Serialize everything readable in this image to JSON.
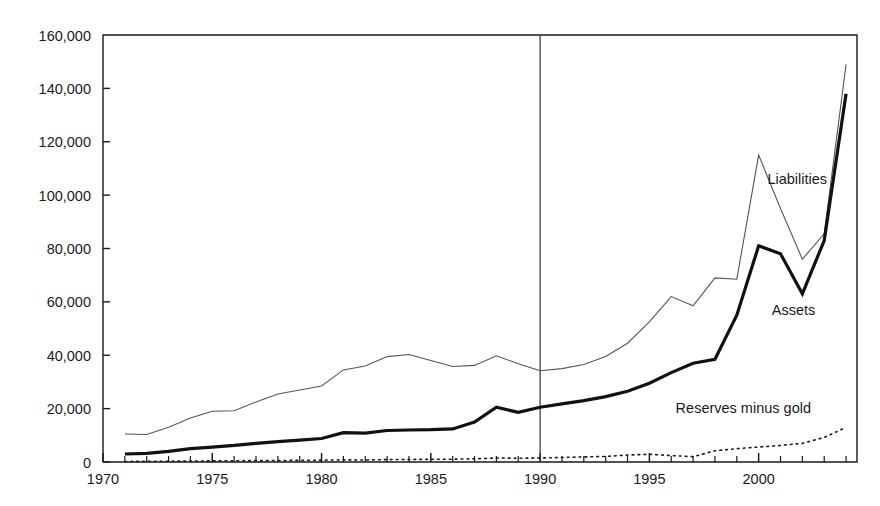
{
  "chart_data": {
    "type": "line",
    "title": "",
    "subtitle": "",
    "xlabel": "",
    "ylabel": "",
    "xlim": [
      1970,
      2004.5
    ],
    "ylim": [
      0,
      160000
    ],
    "grid": false,
    "legend_position": "inline-annotations",
    "y_ticks": [
      0,
      20000,
      40000,
      60000,
      80000,
      100000,
      120000,
      140000,
      160000
    ],
    "y_tick_labels": [
      "0",
      "20,000",
      "40,000",
      "60,000",
      "80,000",
      "100,000",
      "120,000",
      "140,000",
      "160,000"
    ],
    "x_ticks": [
      1970,
      1975,
      1980,
      1985,
      1990,
      1995,
      2000
    ],
    "x_tick_labels": [
      "1970",
      "1975",
      "1980",
      "1985",
      "1990",
      "1995",
      "2000"
    ],
    "x_minor_tick_interval": 1,
    "annotations": [
      {
        "text": "Liabilities",
        "x": 2000.4,
        "y": 104000
      },
      {
        "text": "Assets",
        "x": 2000.6,
        "y": 55000
      },
      {
        "text": "Reserves minus gold",
        "x": 1996.2,
        "y": 18500
      }
    ],
    "reference_lines": [
      {
        "orientation": "vertical",
        "x": 1990,
        "color": "#333333",
        "width": 1.2
      }
    ],
    "x": [
      1971,
      1972,
      1973,
      1974,
      1975,
      1976,
      1977,
      1978,
      1979,
      1980,
      1981,
      1982,
      1983,
      1984,
      1985,
      1986,
      1987,
      1988,
      1989,
      1990,
      1991,
      1992,
      1993,
      1994,
      1995,
      1996,
      1997,
      1998,
      1999,
      2000,
      2001,
      2002,
      2003,
      2004
    ],
    "series": [
      {
        "name": "Liabilities",
        "style": "thin-solid",
        "color": "#555555",
        "line_width": 1.1,
        "values": [
          10500,
          10300,
          13000,
          16500,
          19000,
          19200,
          22500,
          25500,
          27000,
          28500,
          34500,
          36000,
          39500,
          40300,
          38000,
          35800,
          36200,
          39800,
          36800,
          34200,
          35000,
          36500,
          39500,
          44500,
          52500,
          62000,
          58500,
          69000,
          68500,
          115000,
          95000,
          76000,
          85500,
          149000
        ]
      },
      {
        "name": "Assets",
        "style": "thick-solid",
        "color": "#111111",
        "line_width": 3.2,
        "values": [
          3000,
          3200,
          4000,
          5000,
          5600,
          6200,
          7000,
          7600,
          8200,
          8800,
          11000,
          10800,
          11800,
          12000,
          12100,
          12400,
          15000,
          20500,
          18600,
          20500,
          21800,
          23000,
          24500,
          26500,
          29500,
          33500,
          37000,
          38500,
          55000,
          81000,
          78000,
          63000,
          83000,
          138000
        ]
      },
      {
        "name": "Reserves minus gold",
        "style": "dotted",
        "color": "#1a1a1a",
        "line_width": 1.6,
        "values": [
          200,
          250,
          300,
          350,
          420,
          480,
          520,
          560,
          620,
          700,
          800,
          760,
          900,
          950,
          1000,
          1050,
          1200,
          1500,
          1400,
          1500,
          1700,
          1900,
          2100,
          2600,
          2900,
          2400,
          2000,
          4200,
          5000,
          5600,
          6200,
          7000,
          9200,
          13000
        ]
      }
    ]
  }
}
